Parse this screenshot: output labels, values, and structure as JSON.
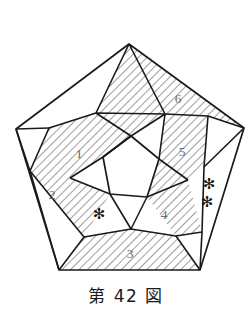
{
  "figure": {
    "caption": "第 42 図",
    "caption_number": "42",
    "caption_prefix": "第",
    "caption_suffix": "図",
    "title": "第 42 図",
    "background_color": "#ffffff",
    "outline_color": "#1a1a1a",
    "hatch_color": "#4a4a4a",
    "label_color": "#6b6b6b",
    "mark_color": "#141414"
  },
  "diagram": {
    "type": "line-drawing",
    "shape": "pentagon-projection",
    "outer_pentagon": {
      "name": "outer-pentagon-boundary",
      "vertices": [
        {
          "id": "top",
          "x": 129,
          "y": 44
        },
        {
          "id": "right",
          "x": 244,
          "y": 128
        },
        {
          "id": "bottom-right",
          "x": 200,
          "y": 270
        },
        {
          "id": "bottom-left",
          "x": 59,
          "y": 270
        },
        {
          "id": "left",
          "x": 16,
          "y": 129
        }
      ]
    },
    "inner_pentagon": {
      "name": "inner-pentagon-center",
      "fill": "white",
      "vertices": [
        {
          "id": "a",
          "x": 131,
          "y": 136
        },
        {
          "id": "b",
          "x": 159,
          "y": 159
        },
        {
          "id": "c",
          "x": 147,
          "y": 197
        },
        {
          "id": "d",
          "x": 110,
          "y": 194
        },
        {
          "id": "e",
          "x": 103,
          "y": 157
        }
      ]
    },
    "mid_ring": {
      "name": "mid-ring-vertices",
      "vertices": [
        {
          "id": "m1",
          "x": 96,
          "y": 113
        },
        {
          "id": "m2",
          "x": 165,
          "y": 114
        },
        {
          "id": "m3",
          "x": 188,
          "y": 180
        },
        {
          "id": "m4",
          "x": 131,
          "y": 229
        },
        {
          "id": "m5",
          "x": 70,
          "y": 178
        }
      ]
    },
    "faces": [
      {
        "id": "face-1",
        "label": "1",
        "label_x": 79,
        "label_y": 155,
        "shaded": true,
        "hatched": true,
        "polygon": "96,113 131,136 103,157 70,178 49,128"
      },
      {
        "id": "face-2",
        "label": "2",
        "label_x": 52,
        "label_y": 196,
        "shaded": true,
        "hatched": true,
        "polygon": "49,128 70,178 110,194 84,237 30,171"
      },
      {
        "id": "face-3",
        "label": "3",
        "label_x": 130,
        "label_y": 255,
        "shaded": true,
        "hatched": true,
        "polygon": "84,237 110,194 147,197 176,236 200,270 59,270"
      },
      {
        "id": "face-4",
        "label": "4",
        "label_x": 164,
        "label_y": 216,
        "shaded": true,
        "hatched": true,
        "polygon": "147,197 159,159 188,180 202,232 176,236"
      },
      {
        "id": "face-5",
        "label": "5",
        "label_x": 182,
        "label_y": 153,
        "shaded": true,
        "hatched": true,
        "polygon": "165,114 208,116 204,167 188,180 159,159"
      },
      {
        "id": "face-6",
        "label": "6",
        "label_x": 178,
        "label_y": 100,
        "shaded": true,
        "hatched": true,
        "polygon": "129,44 244,128 208,116 165,114 131,136 96,113"
      },
      {
        "id": "face-top-left",
        "label": "",
        "shaded": false,
        "hatched": false,
        "polygon": "129,44 96,113 49,128 16,129"
      },
      {
        "id": "face-center",
        "label": "",
        "shaded": false,
        "hatched": false,
        "polygon": "131,136 159,159 147,197 110,194 103,157"
      },
      {
        "id": "face-star-left",
        "label": "",
        "shaded": false,
        "hatched": false,
        "polygon": "110,194 147,197 176,236 131,229 84,237"
      },
      {
        "id": "face-star-right",
        "label": "",
        "shaded": false,
        "hatched": false,
        "polygon": "244,128 204,167 202,232 200,270 208,116"
      }
    ],
    "marks": [
      {
        "id": "asterisk-single",
        "glyph": "✻",
        "x": 99,
        "y": 214,
        "count": 1,
        "region": "lower-left-white-pentagon"
      },
      {
        "id": "asterisk-upper",
        "glyph": "✻",
        "x": 209,
        "y": 184,
        "count": 1,
        "region": "right-white-face"
      },
      {
        "id": "asterisk-lower",
        "glyph": "✻",
        "x": 207,
        "y": 201,
        "count": 1,
        "region": "right-white-face"
      }
    ]
  }
}
